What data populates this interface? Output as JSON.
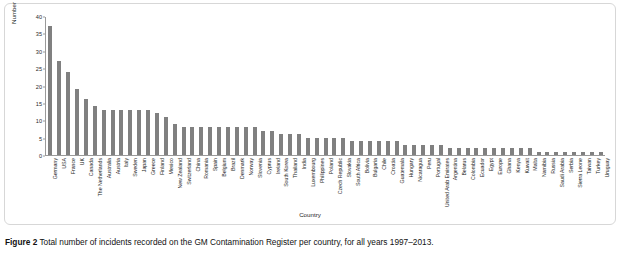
{
  "caption": {
    "label": "Figure 2",
    "text": "Total number of incidents recorded on the GM Contamination Register per country, for all years 1997–2013."
  },
  "chart_data": {
    "type": "bar",
    "title": "",
    "xlabel": "Country",
    "ylabel": "Number of incidents",
    "ylim": [
      0,
      40
    ],
    "yticks": [
      0,
      5,
      10,
      15,
      20,
      25,
      30,
      35,
      40
    ],
    "grid": false,
    "legend": "none",
    "bar_color": "#808080",
    "categories": [
      "Germany",
      "USA",
      "France",
      "UK",
      "Canada",
      "The Netherlands",
      "Australia",
      "Austria",
      "Italy",
      "Sweden",
      "Japan",
      "Greece",
      "Finland",
      "Mexico",
      "New Zealand",
      "Switzerland",
      "China",
      "Romania",
      "Spain",
      "Belgium",
      "Brazil",
      "Denmark",
      "Norway",
      "Slovenia",
      "Cyprus",
      "Ireland",
      "South Korea",
      "Thailand",
      "India",
      "Luxembourg",
      "Philippines",
      "Poland",
      "Czech Republic",
      "Slovakia",
      "South Africa",
      "Bolivia",
      "Bulgaria",
      "Chile",
      "Croatia",
      "Guatemala",
      "Hungary",
      "Nicaragua",
      "Peru",
      "Portugal",
      "United Arab Emirates",
      "Argentina",
      "Belarus",
      "Colombia",
      "Ecuador",
      "Egypt",
      "Europe",
      "Ghana",
      "Kenya",
      "Kuwait",
      "Malta",
      "Namibia",
      "Russia",
      "Saudi Arabia",
      "Serbia",
      "Sierra Leone",
      "Taiwan",
      "Turkey",
      "Uruguay"
    ],
    "values": [
      37,
      27,
      24,
      19,
      16,
      14,
      13,
      13,
      13,
      13,
      13,
      13,
      12,
      11,
      9,
      8,
      8,
      8,
      8,
      8,
      8,
      8,
      8,
      8,
      7,
      7,
      6,
      6,
      6,
      5,
      5,
      5,
      5,
      5,
      4,
      4,
      4,
      4,
      4,
      4,
      3,
      3,
      3,
      3,
      3,
      2,
      2,
      2,
      2,
      2,
      2,
      2,
      2,
      2,
      2,
      1,
      1,
      1,
      1,
      1,
      1,
      1,
      1
    ]
  }
}
